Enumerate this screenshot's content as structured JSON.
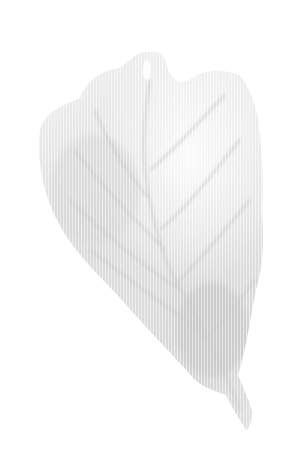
{
  "image": {
    "subject": "leaf",
    "style": "faded halftone grayscale",
    "background_color": "#ffffff",
    "leaf_colors": {
      "light": "#ededed",
      "mid": "#dcdcdc",
      "dark": "#c4c4c4"
    }
  }
}
